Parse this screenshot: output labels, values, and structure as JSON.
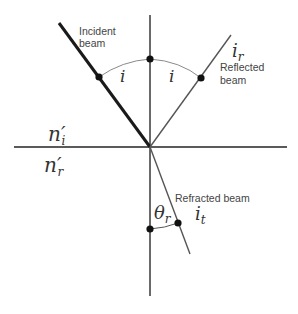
{
  "diagram": {
    "labels": {
      "incident_line1": "Incident",
      "incident_line2": "beam",
      "reflected_line1": "Reflected",
      "reflected_line2": "beam",
      "refracted": "Refracted beam",
      "angle_incident": "i",
      "angle_reflected": "i",
      "reflected_symbol_base": "i",
      "reflected_symbol_sub": "r",
      "refracted_symbol_base": "i",
      "refracted_symbol_sub": "t",
      "theta_base": "θ",
      "theta_sub": "r",
      "n_upper_base": "n′",
      "n_upper_sub": "i",
      "n_lower_base": "n′",
      "n_lower_sub": "r"
    },
    "colors": {
      "incident_beam": "#1a1a1a",
      "lines": "#555555",
      "arc": "#888888",
      "dots": "#111111"
    }
  }
}
